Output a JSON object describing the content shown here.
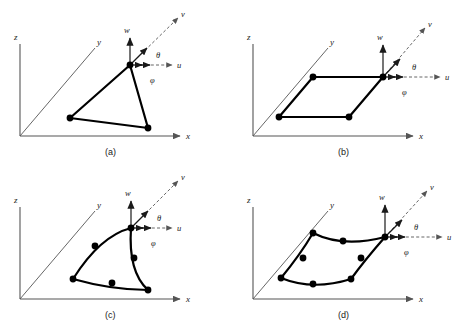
{
  "figure": {
    "type": "technical-diagram",
    "background_color": "#ffffff",
    "line_color": "#1a1a1a",
    "element_color": "#000000",
    "axis_color": "#555555"
  },
  "global_axes": {
    "z_label": "z",
    "y_label": "y",
    "x_label": "x"
  },
  "local_axes": {
    "w_label": "w",
    "v_label": "v",
    "u_label": "u",
    "theta_label": "θ",
    "phi_label": "φ"
  },
  "panels": [
    {
      "caption": "(a)",
      "element": "3-node triangle",
      "node_count": 3,
      "edges": "straight",
      "nodes": [
        {
          "x": 130,
          "y": 65
        },
        {
          "x": 70,
          "y": 118
        },
        {
          "x": 148,
          "y": 128
        }
      ]
    },
    {
      "caption": "(b)",
      "element": "4-node quadrilateral",
      "node_count": 4,
      "edges": "straight",
      "nodes": [
        {
          "x": 383,
          "y": 77
        },
        {
          "x": 313,
          "y": 77
        },
        {
          "x": 279,
          "y": 117
        },
        {
          "x": 349,
          "y": 117
        }
      ]
    },
    {
      "caption": "(c)",
      "element": "6-node curved triangle",
      "node_count": 6,
      "edges": "curved",
      "nodes": [
        {
          "x": 131,
          "y": 228
        },
        {
          "x": 95,
          "y": 246
        },
        {
          "x": 73,
          "y": 279
        },
        {
          "x": 112,
          "y": 283
        },
        {
          "x": 148,
          "y": 290
        },
        {
          "x": 134,
          "y": 258
        }
      ]
    },
    {
      "caption": "(d)",
      "element": "8-node curved quadrilateral",
      "node_count": 8,
      "edges": "curved",
      "nodes": [
        {
          "x": 385,
          "y": 237
        },
        {
          "x": 343,
          "y": 241
        },
        {
          "x": 313,
          "y": 233
        },
        {
          "x": 303,
          "y": 258
        },
        {
          "x": 281,
          "y": 278
        },
        {
          "x": 313,
          "y": 284
        },
        {
          "x": 351,
          "y": 279
        },
        {
          "x": 361,
          "y": 258
        }
      ]
    }
  ]
}
